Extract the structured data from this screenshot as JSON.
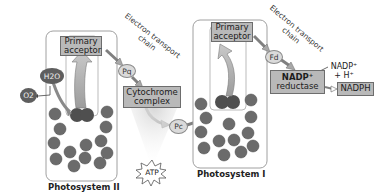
{
  "diagram": {
    "photosystem_2": {
      "label": "Photosystem II",
      "primary_acceptor": "Primary acceptor",
      "water": "H2O",
      "oxygen": "O2"
    },
    "etc_1": {
      "label_line1": "Electron transport",
      "label_line2": "chain",
      "pq": "Pq",
      "cytochrome_line1": "Cytochrome",
      "cytochrome_line2": "complex",
      "pc": "Pc",
      "atp": "ATP"
    },
    "photosystem_1": {
      "label": "Photosystem I",
      "primary_acceptor_line1": "Primary",
      "primary_acceptor_line2": "acceptor"
    },
    "etc_2": {
      "label_line1": "Electron transport",
      "label_line2": "chain",
      "fd": "Fd",
      "reductase_line1": "NADP⁺",
      "reductase_line2": "reductase",
      "nadp_in_line1": "NADP⁺",
      "nadp_in_line2": "+ H⁺",
      "nadph": "NADPH"
    },
    "colors": {
      "box_fill": "#b9b9b9",
      "chlorophyll": "#6b6b6b",
      "reaction_center": "#4f4f4f",
      "panel_border": "#a0a0a0"
    }
  }
}
